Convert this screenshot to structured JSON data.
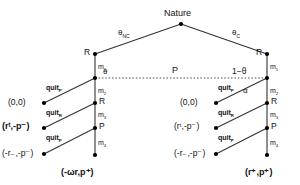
{
  "diagram": {
    "type": "extensive-form-game-tree",
    "title_node": "Nature",
    "colors": {
      "line": "#333333",
      "node": "#000000",
      "background": "#ffffff",
      "dotted": "#555555"
    },
    "nature": {
      "label": "Nature"
    },
    "nature_branches": [
      {
        "name": "left-branch",
        "label": "θ",
        "sub": "NC"
      },
      {
        "name": "right-branch",
        "label": "θ",
        "sub": "C"
      }
    ],
    "info_set": {
      "player_label": "P",
      "left_prob": "θ",
      "right_prob": "1−θ",
      "right_action": "α"
    },
    "left_subtree": {
      "spine_nodes": [
        {
          "name": "node-R-top",
          "label": "R"
        },
        {
          "name": "node-P-info",
          "label": ""
        },
        {
          "name": "node-R-mid",
          "label": "R"
        },
        {
          "name": "node-P-low",
          "label": "P"
        }
      ],
      "move_labels": [
        "m",
        "m",
        "m",
        "m"
      ],
      "move_subs": [
        "1",
        "2",
        "3",
        "4"
      ],
      "quit_labels": [
        {
          "text": "quit",
          "sub": "P"
        },
        {
          "text": "quit",
          "sub": "R"
        },
        {
          "text": "quit",
          "sub": "P"
        }
      ],
      "payoffs": [
        "(0,0)",
        "(rᵗ,-p⁻)",
        "(-r₋,-p⁻)"
      ],
      "terminal_payoff": "(-ωr,p⁺)"
    },
    "right_subtree": {
      "spine_nodes": [
        {
          "name": "node-R-top",
          "label": "R"
        },
        {
          "name": "node-P-info",
          "label": ""
        },
        {
          "name": "node-R-mid",
          "label": "R"
        },
        {
          "name": "node-P-low",
          "label": "P"
        }
      ],
      "move_labels": [
        "m",
        "m",
        "m",
        "m"
      ],
      "move_subs": [
        "1",
        "2",
        "3",
        "4"
      ],
      "quit_labels": [
        {
          "text": "quit",
          "sub": "P"
        },
        {
          "text": "quit",
          "sub": "R"
        },
        {
          "text": "quit",
          "sub": "P"
        }
      ],
      "payoffs": [
        "(0,0)",
        "(rᵗ,-p⁻)",
        "(-r₋,-p⁻)"
      ],
      "terminal_payoff": "(r⁺,p⁺)"
    }
  }
}
